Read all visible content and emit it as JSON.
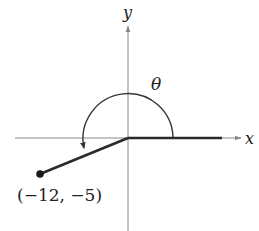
{
  "diagram": {
    "type": "angle-in-standard-position",
    "axes": {
      "x_label": "x",
      "y_label": "y"
    },
    "angle_label": "θ",
    "terminal_point": {
      "x": -12,
      "y": -5,
      "label": "(−12, −5)"
    },
    "colors": {
      "axis": "#8a8a8a",
      "ray": "#2a2a2a",
      "arc": "#333333",
      "text": "#222222"
    }
  }
}
